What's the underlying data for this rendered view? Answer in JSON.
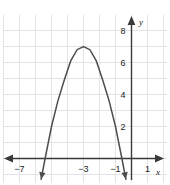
{
  "chart_data": {
    "type": "line",
    "title": "",
    "subtitle": "",
    "xlabel": "x",
    "ylabel": "y",
    "xlim": [
      -8,
      2
    ],
    "ylim": [
      -1,
      9
    ],
    "grid": true,
    "grid_step": 1,
    "legend": null,
    "x_tick_labels": [
      "−7",
      "−3",
      "−1",
      "1"
    ],
    "x_tick_values": [
      -7,
      -3,
      -1,
      1
    ],
    "y_tick_labels": [
      "2",
      "4",
      "6",
      "8"
    ],
    "y_tick_values": [
      2,
      4,
      6,
      8
    ],
    "axis_arrows": [
      "left",
      "right",
      "up"
    ],
    "curve": {
      "name": "parabola",
      "equation_form": "downward parabola",
      "vertex": [
        -3,
        7
      ],
      "roots": [
        -5.4,
        -0.6
      ],
      "direction": "opens-down",
      "end_arrows": [
        "down-left",
        "down-right"
      ],
      "color": "#4d4d4d",
      "x": [
        -5.65,
        -5.4,
        -5.0,
        -4.6,
        -4.2,
        -3.8,
        -3.4,
        -3.0,
        -2.6,
        -2.2,
        -1.8,
        -1.4,
        -1.0,
        -0.6,
        -0.35
      ],
      "y": [
        -1.3,
        0.0,
        2.0,
        3.6,
        4.9,
        6.1,
        6.8,
        7.0,
        6.8,
        6.1,
        4.9,
        3.6,
        2.0,
        0.0,
        -1.3
      ]
    },
    "colors": {
      "grid": "#e3e3e7",
      "axis": "#3a3a3a",
      "curve": "#4d4d4d",
      "text": "#1a1a1a",
      "background": "#ffffff"
    }
  }
}
